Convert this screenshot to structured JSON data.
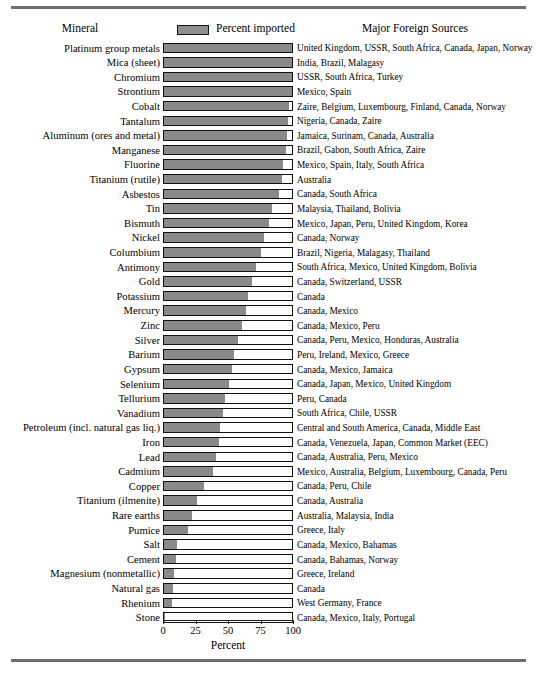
{
  "header": {
    "mineral_label": "Mineral",
    "legend_swatch_name": "percent-imported-swatch",
    "legend_label": "Percent imported",
    "sources_label": "Major Foreign Sources"
  },
  "axis": {
    "title": "Percent",
    "ticks": [
      "0",
      "25",
      "50",
      "75",
      "100"
    ]
  },
  "chart_data": {
    "type": "bar",
    "orientation": "horizontal",
    "title": "",
    "subtitle": "",
    "xlabel": "Percent",
    "ylabel": "Mineral",
    "xlim": [
      0,
      100
    ],
    "ylim": null,
    "grid": false,
    "legend": {
      "position": "top-center",
      "entries": [
        "Percent imported"
      ]
    },
    "series_name": "Percent imported",
    "bar_max": 100,
    "annotations_column": "Major Foreign Sources",
    "categories": [
      "Platinum group metals",
      "Mica (sheet)",
      "Chromium",
      "Strontium",
      "Cobalt",
      "Tantalum",
      "Aluminum (ores and metal)",
      "Manganese",
      "Fluorine",
      "Titanium (rutile)",
      "Asbestos",
      "Tin",
      "Bismuth",
      "Nickel",
      "Columbium",
      "Antimony",
      "Gold",
      "Potassium",
      "Mercury",
      "Zinc",
      "Silver",
      "Barium",
      "Gypsum",
      "Selenium",
      "Tellurium",
      "Vanadium",
      "Petroleum (incl. natural gas liq.)",
      "Iron",
      "Lead",
      "Cadmium",
      "Copper",
      "Titanium (ilmenite)",
      "Rare earths",
      "Pumice",
      "Salt",
      "Cement",
      "Magnesium (nonmetallic)",
      "Natural gas",
      "Rhenium",
      "Stone"
    ],
    "values": [
      100,
      100,
      100,
      100,
      98,
      97,
      96,
      95,
      93,
      92,
      90,
      84,
      82,
      78,
      76,
      72,
      69,
      66,
      64,
      61,
      58,
      55,
      53,
      51,
      48,
      46,
      44,
      43,
      41,
      38,
      31,
      26,
      22,
      19,
      10,
      9,
      8,
      7,
      6,
      1
    ],
    "sources": [
      "United Kingdom, USSR, South Africa, Canada, Japan, Norway",
      "India, Brazil, Malagasy",
      "USSR, South Africa, Turkey",
      "Mexico, Spain",
      "Zaire, Belgium, Luxembourg, Finland, Canada, Norway",
      "Nigeria, Canada, Zaire",
      "Jamaica, Surinam, Canada, Australia",
      "Brazil, Gabon, South Africa, Zaire",
      "Mexico, Spain, Italy, South Africa",
      "Australia",
      "Canada, South Africa",
      "Malaysia, Thailand, Bolivia",
      "Mexico, Japan, Peru, United Kingdom, Korea",
      "Canada, Norway",
      "Brazil, Nigeria, Malagasy, Thailand",
      "South Africa, Mexico, United Kingdom, Bolivia",
      "Canada, Switzerland, USSR",
      "Canada",
      "Canada, Mexico",
      "Canada, Mexico, Peru",
      "Canada, Peru, Mexico, Honduras, Australia",
      "Peru, Ireland, Mexico, Greece",
      "Canada, Mexico, Jamaica",
      "Canada, Japan, Mexico, United Kingdom",
      "Peru, Canada",
      "South Africa, Chile, USSR",
      "Central and South America, Canada, Middle East",
      "Canada, Venezuela, Japan, Common Market (EEC)",
      "Canada, Australia, Peru, Mexico",
      "Mexico, Australia, Belgium, Luxembourg, Canada, Peru",
      "Canada, Peru, Chile",
      "Canada, Australia",
      "Australia, Malaysia, India",
      "Greece, Italy",
      "Canada, Mexico, Bahamas",
      "Canada, Bahamas, Norway",
      "Greece, Ireland",
      "Canada",
      "West Germany, France",
      "Canada, Mexico, Italy, Portugal"
    ]
  },
  "colors": {
    "bar_fill": "#8a8a8a",
    "bar_border": "#111111",
    "bar_background": "#fdfdfd",
    "rule": "#6d6d6d",
    "text": "#000000"
  }
}
